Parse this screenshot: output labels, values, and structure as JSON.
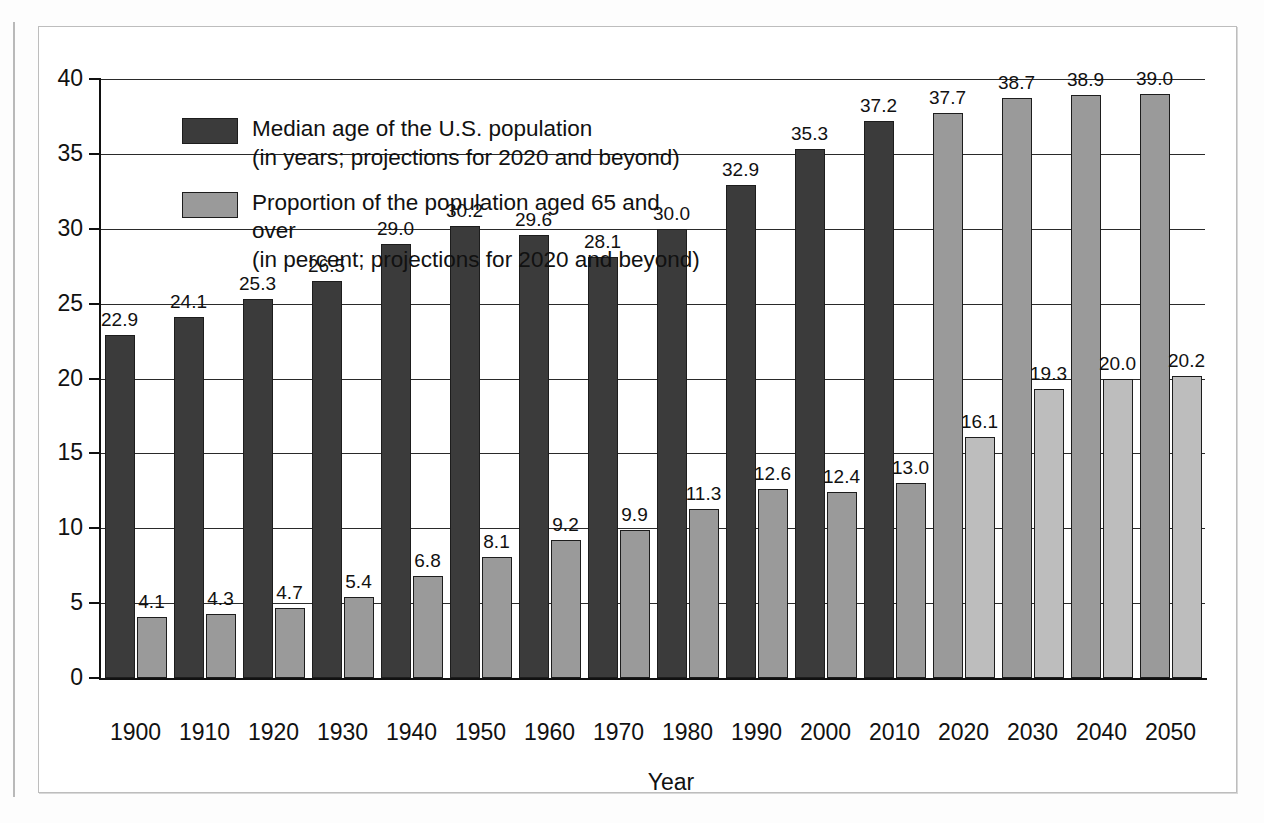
{
  "chart_data": {
    "type": "bar",
    "title": "",
    "xlabel": "Year",
    "ylabel": "",
    "ylim": [
      0,
      40
    ],
    "ytick_step": 5,
    "yticks": [
      "0",
      "5",
      "10",
      "15",
      "20",
      "25",
      "30",
      "35",
      "40"
    ],
    "grid": true,
    "legend_position": "inside-top-left",
    "categories": [
      "1900",
      "1910",
      "1920",
      "1930",
      "1940",
      "1950",
      "1960",
      "1970",
      "1980",
      "1990",
      "2000",
      "2010",
      "2020",
      "2030",
      "2040",
      "2050"
    ],
    "projection_start_category": "2020",
    "series": [
      {
        "name": "Median age of the U.S. population",
        "note": "(in years; projections for 2020 and beyond)",
        "color": "#3b3b3b",
        "projection_color": "#9a9a9a",
        "values": [
          22.9,
          24.1,
          25.3,
          26.5,
          29.0,
          30.2,
          29.6,
          28.1,
          30.0,
          32.9,
          35.3,
          37.2,
          37.7,
          38.7,
          38.9,
          39.0
        ],
        "labels": [
          "22.9",
          "24.1",
          "25.3",
          "26.5",
          "29.0",
          "30.2",
          "29.6",
          "28.1",
          "30.0",
          "32.9",
          "35.3",
          "37.2",
          "37.7",
          "38.7",
          "38.9",
          "39.0"
        ]
      },
      {
        "name": "Proportion of the population aged 65 and over",
        "note": "(in percent; projections for 2020 and beyond)",
        "color": "#9a9a9a",
        "projection_color": "#bdbdbd",
        "values": [
          4.1,
          4.3,
          4.7,
          5.4,
          6.8,
          8.1,
          9.2,
          9.9,
          11.3,
          12.6,
          12.4,
          13.0,
          16.1,
          19.3,
          20.0,
          20.2
        ],
        "labels": [
          "4.1",
          "4.3",
          "4.7",
          "5.4",
          "6.8",
          "8.1",
          "9.2",
          "9.9",
          "11.3",
          "12.6",
          "12.4",
          "13.0",
          "16.1",
          "19.3",
          "20.0",
          "20.2"
        ]
      }
    ]
  },
  "legend": {
    "items": [
      {
        "swatch": "dark",
        "line1": "Median age of the U.S. population",
        "line2": "(in years; projections for 2020 and beyond)"
      },
      {
        "swatch": "mid",
        "line1": "Proportion of the population aged 65 and over",
        "line2": "(in percent; projections for 2020 and beyond)"
      }
    ]
  },
  "axis": {
    "x_title": "Year"
  }
}
